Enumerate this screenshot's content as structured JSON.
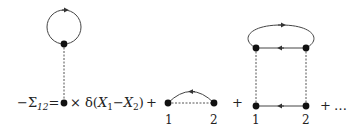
{
  "equation": {
    "lhs": "−Σ",
    "lhs_subscript": "12",
    "equals": "=",
    "term1_suffix": "× δ(",
    "term1_x1": "X",
    "term1_x1_sub": "1",
    "term1_minus": "−",
    "term1_x2": "X",
    "term1_x2_sub": "2",
    "term1_close": ")",
    "plus1": "+",
    "plus2": "+",
    "plus3": "+",
    "ellipsis": "…"
  },
  "diagram2": {
    "label_left": "1",
    "label_right": "2"
  },
  "diagram3": {
    "label_left": "1",
    "label_right": "2"
  },
  "colors": {
    "line": "#333333",
    "dot": "#111111",
    "dashed": "#555555"
  }
}
